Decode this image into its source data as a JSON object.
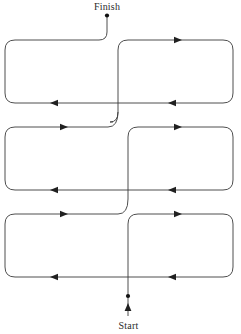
{
  "diagram": {
    "kind": "serpentine-path",
    "canvas": {
      "width": 241,
      "height": 334
    },
    "colors": {
      "background": "#ffffff",
      "wire": "#3a3a3a",
      "arrow": "#202020",
      "dot": "#111111",
      "label": "#2b2b2b"
    },
    "labels": {
      "start": "Start",
      "finish": "Finish"
    },
    "nodes": [
      {
        "name": "start-point",
        "label": "Start",
        "x": 128,
        "y": 296,
        "marker": "dot"
      },
      {
        "name": "finish-point",
        "label": "Finish",
        "x": 107,
        "y": 16,
        "marker": "dot"
      }
    ],
    "loops": [
      {
        "name": "row1-left-loop",
        "row": 1,
        "side": "left",
        "x1": 5,
        "y1": 38,
        "x2": 113,
        "y2": 103,
        "top_arrow": "none",
        "bottom_arrow": "left"
      },
      {
        "name": "row1-right-loop",
        "row": 1,
        "side": "right",
        "x1": 118,
        "y1": 38,
        "x2": 233,
        "y2": 103,
        "top_arrow": "right",
        "bottom_arrow": "left"
      },
      {
        "name": "row2-left-loop",
        "row": 2,
        "side": "left",
        "x1": 5,
        "y1": 125,
        "x2": 113,
        "y2": 190,
        "top_arrow": "right",
        "bottom_arrow": "left"
      },
      {
        "name": "row2-right-loop",
        "row": 2,
        "side": "right",
        "x1": 118,
        "y1": 125,
        "x2": 233,
        "y2": 190,
        "top_arrow": "right",
        "bottom_arrow": "left"
      },
      {
        "name": "row3-left-loop",
        "row": 3,
        "side": "left",
        "x1": 5,
        "y1": 212,
        "x2": 113,
        "y2": 277,
        "top_arrow": "right",
        "bottom_arrow": "left"
      },
      {
        "name": "row3-right-loop",
        "row": 3,
        "side": "right",
        "x1": 118,
        "y1": 212,
        "x2": 233,
        "y2": 277,
        "top_arrow": "right",
        "bottom_arrow": "left"
      }
    ],
    "arrow_markers": [
      {
        "name": "arrow-row1-right-top",
        "direction": "right",
        "x": 180,
        "y": 38
      },
      {
        "name": "arrow-row1-left-bottom",
        "direction": "left",
        "x": 52,
        "y": 103
      },
      {
        "name": "arrow-row1-right-bottom",
        "direction": "left",
        "x": 170,
        "y": 103
      },
      {
        "name": "arrow-row2-left-top",
        "direction": "right",
        "x": 66,
        "y": 125
      },
      {
        "name": "arrow-row2-right-top",
        "direction": "right",
        "x": 180,
        "y": 125
      },
      {
        "name": "arrow-row2-left-bottom",
        "direction": "left",
        "x": 52,
        "y": 190
      },
      {
        "name": "arrow-row2-right-bottom",
        "direction": "left",
        "x": 170,
        "y": 190
      },
      {
        "name": "arrow-row3-left-top",
        "direction": "right",
        "x": 66,
        "y": 212
      },
      {
        "name": "arrow-row3-right-top",
        "direction": "right",
        "x": 180,
        "y": 212
      },
      {
        "name": "arrow-row3-left-bottom",
        "direction": "left",
        "x": 52,
        "y": 277
      },
      {
        "name": "arrow-row3-right-bottom",
        "direction": "left",
        "x": 170,
        "y": 277
      },
      {
        "name": "arrow-start-stem",
        "direction": "up",
        "x": 128,
        "y": 308
      }
    ],
    "connectors": [
      {
        "name": "start-stem",
        "from": "start-label",
        "to": "start-point",
        "orientation": "vertical"
      },
      {
        "name": "start-to-row3-right",
        "from": "start-point",
        "to": "row3-right-loop",
        "orientation": "vertical"
      },
      {
        "name": "row3-to-row2-scurve",
        "from": "row3-left-loop",
        "to": "row2-right-loop",
        "orientation": "s-curve"
      },
      {
        "name": "row2-to-row1-scurve",
        "from": "row2-left-loop",
        "to": "row1-right-loop",
        "orientation": "s-curve"
      },
      {
        "name": "row1-to-finish",
        "from": "row1-left-loop",
        "to": "finish-point",
        "orientation": "vertical"
      }
    ]
  }
}
